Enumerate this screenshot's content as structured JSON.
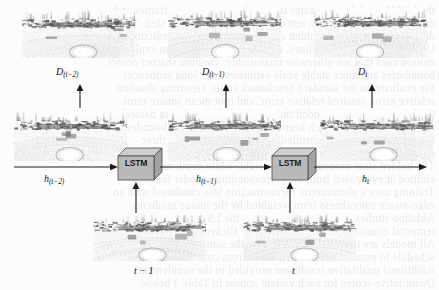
{
  "figure": {
    "type": "lstm-depth-sequence-diagram",
    "background_color": "#fdfdfd",
    "ink_color": "#111111"
  },
  "top_row": {
    "panels": [
      {
        "name": "depth-map-t-minus-2",
        "seed": 11
      },
      {
        "name": "depth-map-t-minus-1",
        "seed": 23
      },
      {
        "name": "depth-map-t",
        "seed": 37
      }
    ],
    "labels": [
      {
        "base": "D",
        "sub": "(t−2)"
      },
      {
        "base": "D",
        "sub": "(t−1)"
      },
      {
        "base": "D",
        "sub": "t"
      }
    ]
  },
  "middle_row": {
    "panels": [
      {
        "name": "feature-map-t-minus-2",
        "seed": 53
      },
      {
        "name": "feature-map-t-minus-1",
        "seed": 67
      },
      {
        "name": "feature-map-t",
        "seed": 79
      }
    ],
    "hidden_state_labels": [
      {
        "base": "h",
        "sub": "(t−2)"
      },
      {
        "base": "h",
        "sub": "(t−1)"
      },
      {
        "base": "h",
        "sub": "t"
      }
    ],
    "lstm_blocks": [
      {
        "label": "LSTM"
      },
      {
        "label": "LSTM"
      }
    ]
  },
  "bottom_row": {
    "panels": [
      {
        "name": "input-frame-t-minus-1",
        "seed": 91
      },
      {
        "name": "input-frame-t",
        "seed": 103
      }
    ],
    "labels": [
      {
        "text": "t − 1"
      },
      {
        "text": "t"
      }
    ]
  },
  "colors": {
    "lstm_face": "#b9b9b9",
    "lstm_top": "#cfcfcf",
    "lstm_side": "#a3a3a3",
    "lstm_stroke": "#4a4a4a",
    "arrow": "#1a1a1a",
    "panel_background": "#f4f4f4"
  },
  "bleed_text": [
    "the LSTM module aggregates temporal context across frames and",
    "produces a refined hidden representation for each time step. The",
    "decoder then maps the hidden state to a dense depth prediction.",
    "Unlike single-frame baselines, the recurrent formulation exploits",
    "motion cues that are otherwise unavailable, yielding sharper object",
    "boundaries and more stable scale estimates over long sequences.",
    "We evaluate on the standard benchmark splits, reporting absolute",
    "relative error, squared relative error, and root mean square error.",
    "Each input frame is encoded independently before being passed to",
    "the recurrent stage, which keeps the memory footprint bounded.",
    "Figure 4 illustrates the unrolled computation graph for three",
    "consecutive time steps of the proposed architecture.",
    "The hidden state propagates left to right, while depth maps are",
    "emitted at every step from the corresponding encoder features.",
    "Training uses a photometric reconstruction loss combined with an",
    "edge-aware smoothness term weighted by the image gradients.",
    "Ablation studies confirm that removing the LSTM severely degrades",
    "temporal consistency, producing visible flicker between frames.",
    "All models are trained end to end with the same optimizer and",
    "schedule to ensure a fair comparison across configurations.",
    "Additional qualitative results are provided in the supplement.",
    "Quantitative scores for each variant appear in Table 3 below.",
    "the proposed LSTM network couples spatial and temporal priors."
  ]
}
